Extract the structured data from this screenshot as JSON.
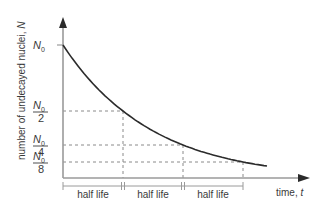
{
  "chart_data": {
    "type": "line",
    "title": "",
    "xlabel": "time, t",
    "ylabel": "number of undecayed nuclei, N",
    "x_label_text": "time, ",
    "x_label_var": "t",
    "y_label_text": "number of undecayed nuclei, ",
    "y_label_var": "N",
    "y_ticks": [
      {
        "num": "N",
        "sub": "0",
        "den": "",
        "value": 1.0
      },
      {
        "num": "N",
        "sub": "0",
        "den": "2",
        "value": 0.5
      },
      {
        "num": "N",
        "sub": "0",
        "den": "4",
        "value": 0.25
      },
      {
        "num": "N",
        "sub": "0",
        "den": "8",
        "value": 0.125
      }
    ],
    "half_life_label": "half life",
    "half_lives": 3,
    "curve": {
      "type": "exponential_decay",
      "initial": 1.0,
      "x_end_half_lives": 3.4
    },
    "ylim": [
      0,
      1.3
    ],
    "xlim": [
      0,
      3.4
    ],
    "colors": {
      "axis": "#9a9a9a",
      "curve": "#2b2b2b",
      "dashed": "#8a8a8a",
      "text": "#3a3a3a"
    }
  }
}
